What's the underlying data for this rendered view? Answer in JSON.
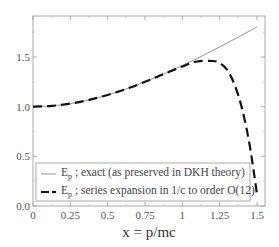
{
  "chart_data": {
    "type": "line",
    "title": "",
    "xlabel": "x = p/mc",
    "ylabel": "",
    "xlim": [
      0,
      1.5
    ],
    "ylim": [
      0,
      1.85
    ],
    "grid": false,
    "legend_position": "lower-center",
    "x_ticks": [
      "0",
      "0.25",
      "0.5",
      "0.75",
      "1",
      "1.25",
      "1.5"
    ],
    "y_ticks": [
      "0.0",
      "0.5",
      "1.0",
      "1.5"
    ],
    "series": [
      {
        "name": "E_p ; exact (as preserved in DKH theory)",
        "legend_main": "E",
        "legend_sub": "p",
        "legend_rest": " ; exact (as preserved in DKH theory)",
        "style": "solid-thin",
        "color": "#888888",
        "x": [
          0,
          0.125,
          0.25,
          0.375,
          0.5,
          0.625,
          0.75,
          0.875,
          1.0,
          1.125,
          1.25,
          1.375,
          1.5
        ],
        "values": [
          1.0,
          1.008,
          1.031,
          1.068,
          1.118,
          1.179,
          1.25,
          1.329,
          1.414,
          1.505,
          1.601,
          1.701,
          1.803
        ]
      },
      {
        "name": "E_p ; series expansion in 1/c to order O(12)",
        "legend_main": "E",
        "legend_sub": "p",
        "legend_rest": " ; series expansion in 1/c to order O(12)",
        "style": "dashed-thick",
        "color": "#111111",
        "x": [
          0,
          0.125,
          0.25,
          0.375,
          0.5,
          0.625,
          0.75,
          0.875,
          1.0,
          1.1,
          1.2,
          1.25,
          1.3,
          1.35,
          1.4,
          1.45,
          1.5
        ],
        "values": [
          1.0,
          1.008,
          1.031,
          1.068,
          1.118,
          1.179,
          1.25,
          1.328,
          1.405,
          1.455,
          1.46,
          1.44,
          1.37,
          1.22,
          0.98,
          0.62,
          0.12
        ]
      }
    ]
  }
}
